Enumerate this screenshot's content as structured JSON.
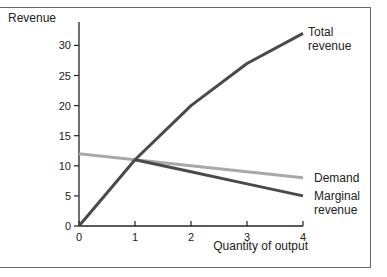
{
  "chart_data": {
    "type": "line",
    "title": "",
    "xlabel": "Quantity of output",
    "ylabel": "Revenue",
    "xlim": [
      0,
      4
    ],
    "ylim": [
      0,
      30
    ],
    "x_ticks": [
      "0",
      "1",
      "2",
      "3",
      "4"
    ],
    "y_ticks": [
      "0",
      "5",
      "10",
      "15",
      "20",
      "25",
      "30"
    ],
    "grid": false,
    "x": [
      0,
      1,
      2,
      3,
      4
    ],
    "series": [
      {
        "name": "Total revenue",
        "label_lines": [
          "Total",
          "revenue"
        ],
        "color": "#4a4a4a",
        "values": [
          0,
          11,
          20,
          27,
          32
        ]
      },
      {
        "name": "Demand",
        "label_lines": [
          "Demand"
        ],
        "color": "#a8a8a8",
        "values": [
          12,
          11,
          10,
          9,
          8
        ]
      },
      {
        "name": "Marginal revenue",
        "label_lines": [
          "Marginal",
          "revenue"
        ],
        "color": "#4a4a4a",
        "x": [
          1,
          2,
          3,
          4
        ],
        "values": [
          11,
          9,
          7,
          5
        ]
      }
    ],
    "legend_position": "inline-right"
  }
}
